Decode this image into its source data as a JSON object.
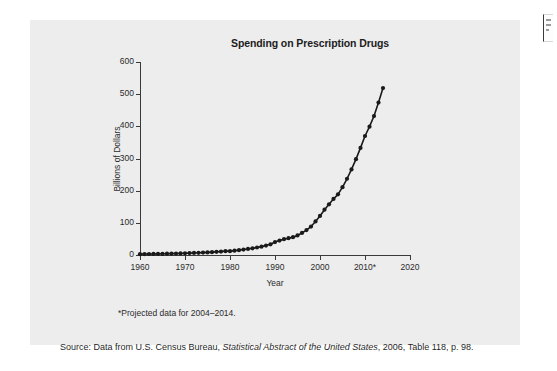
{
  "figure": {
    "background_color": "#ededed",
    "footnote": "*Projected data for 2004–2014.",
    "source": {
      "prefix": "Source: Data from U.S. Census Bureau, ",
      "italic_title": "Statistical Abstract of the United States",
      "suffix": ", 2006, Table 118, p. 98."
    }
  },
  "page_edge_marker": {
    "name": "page-edge-marker"
  },
  "chart_data": {
    "type": "line",
    "title": "Spending on Prescription Drugs",
    "xlabel": "Year",
    "ylabel": "Billions of Dollars",
    "xlim": [
      1960,
      2020
    ],
    "ylim": [
      0,
      600
    ],
    "xticks": [
      1960,
      1970,
      1980,
      1990,
      2000,
      2010,
      2020
    ],
    "xticklabels": [
      "1960",
      "1970",
      "1980",
      "1990",
      "2000",
      "2010*",
      "2020"
    ],
    "yticks": [
      0,
      100,
      200,
      300,
      400,
      500,
      600
    ],
    "yticklabels": [
      "0",
      "100",
      "200",
      "300",
      "400",
      "500",
      "600"
    ],
    "grid": false,
    "legend": false,
    "line_color": "#1a1a1a",
    "marker": "circle",
    "marker_size": 2.1,
    "annotations": [
      "*Projected data for 2004–2014."
    ],
    "x": [
      1960,
      1961,
      1962,
      1963,
      1964,
      1965,
      1966,
      1967,
      1968,
      1969,
      1970,
      1971,
      1972,
      1973,
      1974,
      1975,
      1976,
      1977,
      1978,
      1979,
      1980,
      1981,
      1982,
      1983,
      1984,
      1985,
      1986,
      1987,
      1988,
      1989,
      1990,
      1991,
      1992,
      1993,
      1994,
      1995,
      1996,
      1997,
      1998,
      1999,
      2000,
      2001,
      2002,
      2003,
      2004,
      2005,
      2006,
      2007,
      2008,
      2009,
      2010,
      2011,
      2012,
      2013,
      2014
    ],
    "values": [
      2.7,
      2.9,
      3.1,
      3.3,
      3.5,
      3.7,
      4.0,
      4.3,
      4.6,
      5.0,
      5.5,
      5.9,
      6.3,
      6.8,
      7.4,
      8.1,
      8.9,
      9.8,
      10.8,
      12.0,
      12.0,
      13.5,
      15.1,
      16.9,
      18.8,
      20.9,
      23.3,
      26.0,
      29.4,
      33.3,
      40.3,
      44.8,
      49.2,
      52.3,
      55.5,
      60.9,
      68.5,
      77.4,
      88.5,
      104.4,
      121.5,
      140.8,
      157.6,
      174.2,
      188.5,
      211.0,
      237.0,
      266.0,
      298.0,
      333.0,
      370.0,
      399.0,
      432.0,
      474.0,
      519.0
    ]
  }
}
